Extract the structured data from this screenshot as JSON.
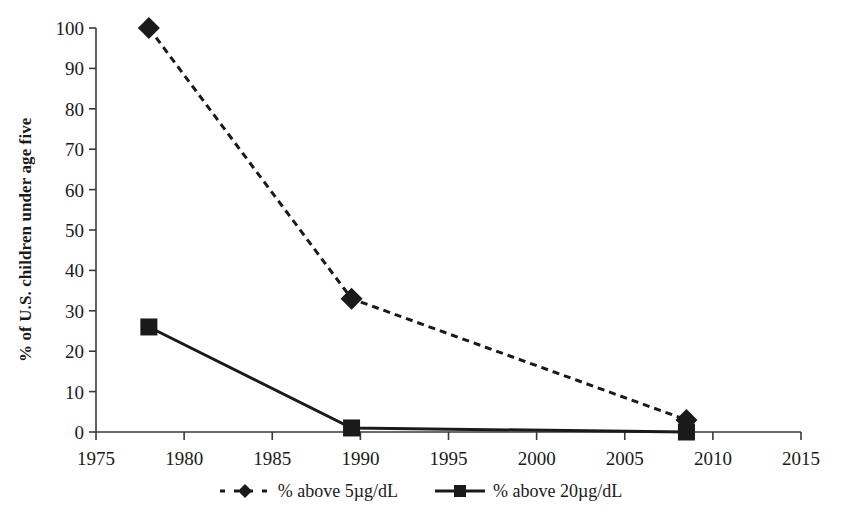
{
  "chart_data": {
    "type": "line",
    "title": "",
    "xlabel": "",
    "ylabel": "% of U.S. children under age five",
    "xlim": [
      1975,
      2015
    ],
    "ylim": [
      0,
      100
    ],
    "xticks": [
      1975,
      1980,
      1985,
      1990,
      1995,
      2000,
      2005,
      2010,
      2015
    ],
    "yticks": [
      0,
      10,
      20,
      30,
      40,
      50,
      60,
      70,
      80,
      90,
      100
    ],
    "xtick_labels": [
      "1975",
      "1980",
      "1985",
      "1990",
      "1995",
      "2000",
      "2005",
      "2010",
      "2015"
    ],
    "ytick_labels": [
      "0",
      "10",
      "20",
      "30",
      "40",
      "50",
      "60",
      "70",
      "80",
      "90",
      "100"
    ],
    "grid": false,
    "legend_position": "bottom-center",
    "series": [
      {
        "name": "% above 5µg/dL",
        "marker": "diamond",
        "line_style": "dashed",
        "color": "#1a1a1a",
        "x": [
          1978,
          1989.5,
          2008.5
        ],
        "values": [
          100,
          33,
          3
        ]
      },
      {
        "name": "% above 20µg/dL",
        "marker": "square",
        "line_style": "solid",
        "color": "#1a1a1a",
        "x": [
          1978,
          1989.5,
          2008.5
        ],
        "values": [
          26,
          1,
          0
        ]
      }
    ]
  },
  "legend": {
    "entries": [
      {
        "label": "% above 5µg/dL"
      },
      {
        "label": "% above 20µg/dL"
      }
    ]
  },
  "colors": {
    "ink": "#1a1a1a",
    "axis": "#3a3a3a",
    "background": "#ffffff"
  }
}
